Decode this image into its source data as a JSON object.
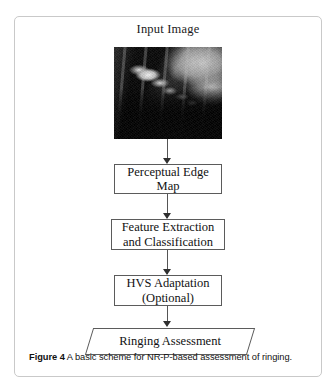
{
  "figure": {
    "caption_label": "Figure 4",
    "caption_text": "A basic scheme for NR-P-based assessment of ringing."
  },
  "flowchart": {
    "title": "Input Image",
    "input_image": {
      "name": "input-photo",
      "description": "Grayscale photograph"
    },
    "nodes": [
      {
        "id": "perceptual-edge-map",
        "shape": "rect",
        "label": "Perceptual Edge Map"
      },
      {
        "id": "feature-extraction-and-classification",
        "shape": "rect",
        "label": "Feature Extraction and Classification"
      },
      {
        "id": "hvs-adaptation",
        "shape": "rect",
        "label": "HVS Adaptation (Optional)"
      },
      {
        "id": "ringing-assessment",
        "shape": "parallelogram",
        "label": "Ringing Assessment"
      }
    ],
    "node_labels": {
      "perceptual_edge_map_line1": "Perceptual Edge",
      "perceptual_edge_map_line2": "Map",
      "feature_extraction_line1": "Feature Extraction",
      "feature_extraction_line2": "and Classification",
      "hvs_adaptation_line1": "HVS Adaptation",
      "hvs_adaptation_line2": "(Optional)",
      "ringing_assessment": "Ringing Assessment"
    }
  },
  "colors": {
    "card_border": "#c9c9c9",
    "box_border": "#5b5b5b",
    "connector": "#555555",
    "text": "#111111",
    "background": "#ffffff"
  }
}
